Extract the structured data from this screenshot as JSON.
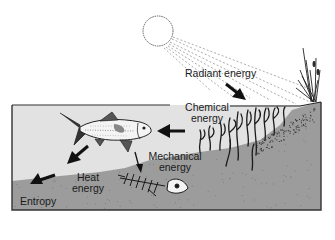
{
  "diagram": {
    "colors": {
      "water": "#e2e2e2",
      "ground": "#9c9c9c",
      "ink": "#1a1a1a",
      "background": "#ffffff"
    },
    "labels": {
      "radiant": "Radiant energy",
      "chemical_line1": "Chemical",
      "chemical_line2": "energy",
      "mechanical_line1": "Mechanical",
      "mechanical_line2": "energy",
      "heat_line1": "Heat",
      "heat_line2": "energy",
      "entropy": "Entropy"
    },
    "flow": [
      {
        "from": "sun",
        "to": "plants",
        "form": "Radiant energy"
      },
      {
        "from": "plants",
        "to": "fish",
        "form": "Chemical energy"
      },
      {
        "from": "fish",
        "to": "remains",
        "form": "Mechanical energy"
      },
      {
        "from": "fish",
        "to": "surroundings",
        "form": "Heat energy"
      },
      {
        "from": "heat",
        "to": "entropy",
        "form": "Entropy"
      }
    ],
    "icons": [
      "sun-icon",
      "sun-rays",
      "reeds-icon",
      "aquatic-plants-icon",
      "fish-icon",
      "fish-skeleton-icon"
    ]
  }
}
